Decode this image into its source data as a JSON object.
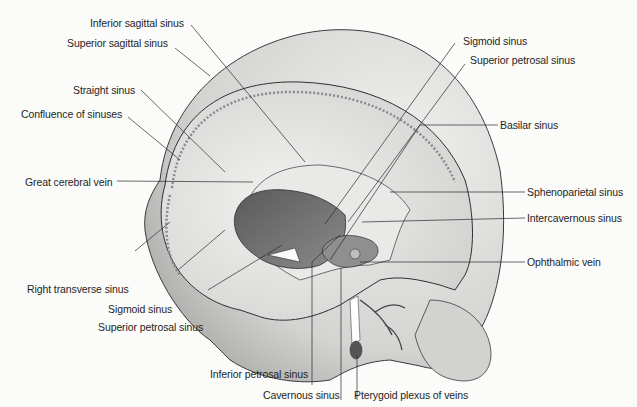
{
  "figure": {
    "background_color": "#fbfbfa",
    "illustration_colors": {
      "skull_outer": "#d9d9d8",
      "dura": "#e6e6e5",
      "cavity_dark": "#6e6e6e",
      "line": "#2a2a2a"
    }
  },
  "labels": {
    "inferior_sagittal_sinus": "Inferior sagittal sinus",
    "superior_sagittal_sinus": "Superior sagittal sinus",
    "straight_sinus": "Straight sinus",
    "confluence_of_sinuses": "Confluence of sinuses",
    "great_cerebral_vein": "Great cerebral vein",
    "right_transverse_sinus": "Right transverse sinus",
    "sigmoid_sinus_left": "Sigmoid sinus",
    "superior_petrosal_sinus_left": "Superior petrosal sinus",
    "inferior_petrosal_sinus": "Inferior petrosal sinus",
    "cavernous_sinus": "Cavernous sinus",
    "pterygoid_plexus": "Pterygoid plexus of veins",
    "sigmoid_sinus_right": "Sigmoid sinus",
    "superior_petrosal_sinus_right": "Superior petrosal sinus",
    "basilar_sinus": "Basilar sinus",
    "sphenoparietal_sinus": "Sphenoparietal sinus",
    "intercavernous_sinus": "Intercavernous sinus",
    "ophthalmic_vein": "Ophthalmic vein"
  }
}
